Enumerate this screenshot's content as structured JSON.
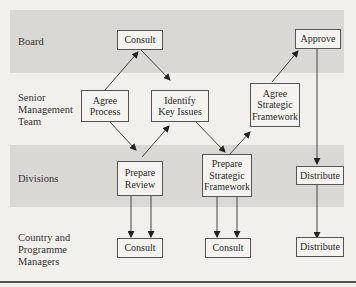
{
  "lanes": [
    {
      "label": "Board"
    },
    {
      "label": "Senior\nManagement\nTeam"
    },
    {
      "label": "Divisions"
    },
    {
      "label": "Country and\nProgramme\nManagers"
    }
  ],
  "nodes": {
    "consult_board": "Consult",
    "approve": "Approve",
    "agree_process": "Agree\nProcess",
    "identify_key_issues": "Identify\nKey Issues",
    "agree_strategic_framework": "Agree\nStrategic\nFramework",
    "prepare_review": "Prepare\nReview",
    "prepare_strategic_framework": "Prepare\nStrategic\nFramework",
    "distribute_divisions": "Distribute",
    "consult_cpm_1": "Consult",
    "consult_cpm_2": "Consult",
    "distribute_cpm": "Distribute"
  },
  "colors": {
    "band": "#d9d8d4",
    "background": "#f1f0ec",
    "line": "#444444"
  }
}
